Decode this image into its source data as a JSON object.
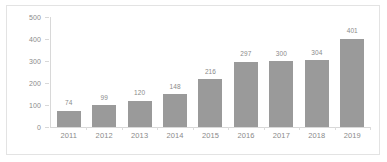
{
  "chart_data": {
    "type": "bar",
    "title": "",
    "subtitle": "",
    "xlabel": "",
    "ylabel": "",
    "categories": [
      "2011",
      "2012",
      "2013",
      "2014",
      "2015",
      "2016",
      "2017",
      "2018",
      "2019"
    ],
    "values": [
      74,
      99,
      120,
      148,
      216,
      297,
      300,
      304,
      401
    ],
    "data_labels": [
      "74",
      "99",
      "120",
      "148",
      "216",
      "297",
      "300",
      "304",
      "401"
    ],
    "ylim": [
      0,
      500
    ],
    "ytick_labels": [
      "0",
      "100",
      "200",
      "300",
      "400",
      "500"
    ],
    "ytick_values": [
      0,
      100,
      200,
      300,
      400,
      500
    ],
    "grid": false,
    "legend": null,
    "legend_position": "none",
    "bar_color": "#9a9a9a",
    "axis_color": "#d8d8d8",
    "label_color": "#8a8a8a",
    "border_color": "#e3e3e3",
    "background": "#ffffff"
  }
}
